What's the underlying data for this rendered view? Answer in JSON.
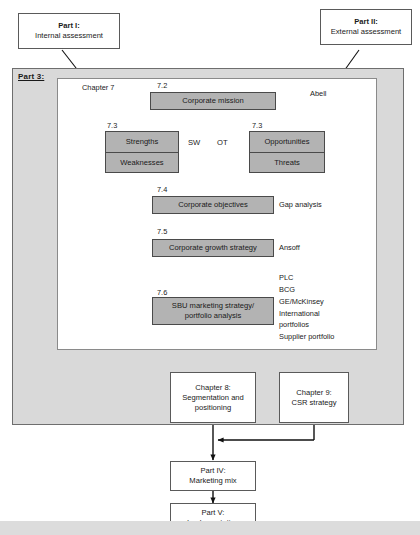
{
  "diagram": {
    "colors": {
      "process_box_fill": "#b3b3b3",
      "outer_frame_fill": "#d9d9d9",
      "inner_frame_fill": "#ffffff",
      "box_stroke": "#4a4a4a",
      "arrow_stroke": "#111111",
      "bottom_strip": "#dcdcdc"
    },
    "part_boxes": {
      "part1": {
        "line1": "Part I:",
        "line2": "Internal assessment"
      },
      "part2": {
        "line1": "Part II:",
        "line2": "External assessment"
      },
      "part4": {
        "line1": "Part IV:",
        "line2": "Marketing mix"
      },
      "part5": {
        "line1": "Part V:",
        "line2": "Implementation"
      }
    },
    "part3_label": "Part 3:",
    "chapter_labels": {
      "chapter7": "Chapter 7",
      "abell": "Abell"
    },
    "section_numbers": {
      "mission": "7.2",
      "swot_left": "7.3",
      "swot_right": "7.3",
      "objectives": "7.4",
      "growth": "7.5",
      "sbu": "7.6"
    },
    "process_boxes": {
      "mission": "Corporate mission",
      "objectives": "Corporate objectives",
      "growth": "Corporate growth strategy",
      "sbu_line1": "SBU marketing strategy/",
      "sbu_line2": "portfolio analysis"
    },
    "swot": {
      "left_top": "Strengths",
      "left_bottom": "Weaknesses",
      "right_top": "Opportunities",
      "right_bottom": "Threats",
      "label_sw": "SW",
      "label_ot": "OT"
    },
    "side_notes": {
      "gap_analysis": "Gap analysis",
      "ansoff": "Ansoff",
      "portfolio_tools": [
        "PLC",
        "BCG",
        "GE/McKinsey",
        "International",
        "portfolios",
        "Supplier portfolio"
      ]
    },
    "chapter_boxes": {
      "chapter8": {
        "line1": "Chapter 8:",
        "line2": "Segmentation and",
        "line3": "positioning"
      },
      "chapter9": {
        "line1": "Chapter 9:",
        "line2": "CSR strategy"
      }
    }
  }
}
